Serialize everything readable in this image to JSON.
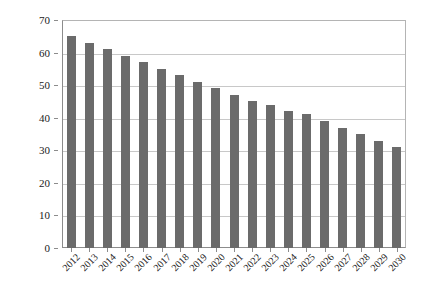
{
  "chart_data": {
    "type": "bar",
    "title": "",
    "subtitle": "",
    "xlabel": "",
    "ylabel": "",
    "categories": [
      "2012",
      "2013",
      "2014",
      "2015",
      "2016",
      "2017",
      "2018",
      "2019",
      "2020",
      "2021",
      "2022",
      "2023",
      "2024",
      "2025",
      "2026",
      "2027",
      "2028",
      "2029",
      "2030"
    ],
    "values": [
      65,
      63,
      61,
      59,
      57,
      55,
      53,
      51,
      49,
      47,
      45,
      44,
      42,
      41,
      39,
      37,
      35,
      33,
      31
    ],
    "series": [
      {
        "name": "",
        "values": [
          65,
          63,
          61,
          59,
          57,
          55,
          53,
          51,
          49,
          47,
          45,
          44,
          42,
          41,
          39,
          37,
          35,
          33,
          31
        ]
      }
    ],
    "ylim": [
      0,
      70
    ],
    "ytick_step": 10,
    "yticks": [
      0,
      10,
      20,
      30,
      40,
      50,
      60,
      70
    ],
    "ytick_labels": [
      "0",
      "10",
      "20",
      "30",
      "40",
      "50",
      "60",
      "70"
    ],
    "grid": "horizontal",
    "legend": "none",
    "annotations": [],
    "colors": {
      "bar": "#6b6b6b",
      "gridline": "#c8c8c8",
      "axis": "#8c8c8c",
      "frame": "#b4b4b4",
      "text": "#1a1a1a",
      "background": "#ffffff"
    },
    "xtick_label_rotation": -45
  }
}
